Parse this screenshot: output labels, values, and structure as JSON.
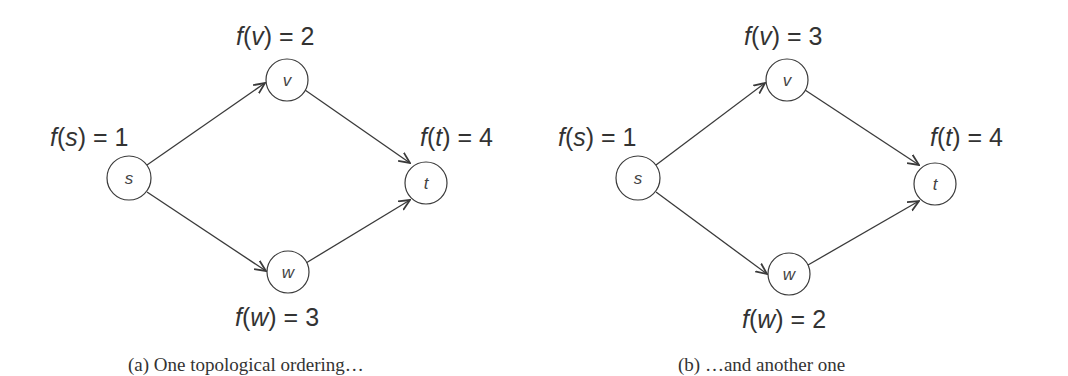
{
  "figure": {
    "panels": [
      {
        "id": "a",
        "caption": "(a)  One topological ordering…",
        "nodes": [
          {
            "id": "s",
            "label": "s",
            "order_fn": "f(s) = 1",
            "value": 1
          },
          {
            "id": "v",
            "label": "v",
            "order_fn": "f(v) = 2",
            "value": 2
          },
          {
            "id": "w",
            "label": "w",
            "order_fn": "f(w) = 3",
            "value": 3
          },
          {
            "id": "t",
            "label": "t",
            "order_fn": "f(t) = 4",
            "value": 4
          }
        ],
        "edges": [
          {
            "from": "s",
            "to": "v"
          },
          {
            "from": "s",
            "to": "w"
          },
          {
            "from": "v",
            "to": "t"
          },
          {
            "from": "w",
            "to": "t"
          }
        ]
      },
      {
        "id": "b",
        "caption": "(b)  …and another one",
        "nodes": [
          {
            "id": "s",
            "label": "s",
            "order_fn": "f(s) = 1",
            "value": 1
          },
          {
            "id": "v",
            "label": "v",
            "order_fn": "f(v) = 3",
            "value": 3
          },
          {
            "id": "w",
            "label": "w",
            "order_fn": "f(w) = 2",
            "value": 2
          },
          {
            "id": "t",
            "label": "t",
            "order_fn": "f(t) = 4",
            "value": 4
          }
        ],
        "edges": [
          {
            "from": "s",
            "to": "v"
          },
          {
            "from": "s",
            "to": "w"
          },
          {
            "from": "v",
            "to": "t"
          },
          {
            "from": "w",
            "to": "t"
          }
        ]
      }
    ]
  },
  "labels": {
    "a": {
      "s": {
        "f": "f",
        "arg": "s",
        "rest": " = 1"
      },
      "v": {
        "f": "f",
        "arg": "v",
        "rest": " = 2"
      },
      "w": {
        "f": "f",
        "arg": "w",
        "rest": " = 3"
      },
      "t": {
        "f": "f",
        "arg": "t",
        "rest": " = 4"
      }
    },
    "b": {
      "s": {
        "f": "f",
        "arg": "s",
        "rest": " = 1"
      },
      "v": {
        "f": "f",
        "arg": "v",
        "rest": " = 3"
      },
      "w": {
        "f": "f",
        "arg": "w",
        "rest": " = 2"
      },
      "t": {
        "f": "f",
        "arg": "t",
        "rest": " = 4"
      }
    }
  }
}
